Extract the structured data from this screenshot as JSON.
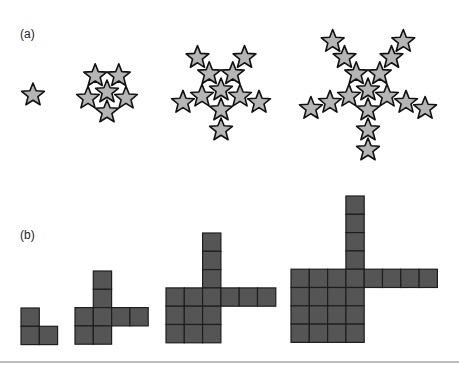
{
  "figure": {
    "panels": [
      {
        "id": "a",
        "label": "(a)",
        "label_pos": [
          20,
          27
        ]
      },
      {
        "id": "b",
        "label": "(b)",
        "label_pos": [
          20,
          228
        ]
      }
    ],
    "colors": {
      "star_fill": "#b5b5b5",
      "star_stroke": "#111111",
      "square_fill": "#555555",
      "square_stroke": "#1e1e1e",
      "rule": "#bdbdbd"
    },
    "star_fractals": {
      "outer_radius": 12,
      "inner_radius": 5.2,
      "ring_spacing": 20,
      "generations": [
        {
          "stage": 1,
          "center": [
            33,
            95
          ],
          "rings": 0
        },
        {
          "stage": 2,
          "center": [
            107,
            92
          ],
          "rings": 1
        },
        {
          "stage": 3,
          "center": [
            221,
            90
          ],
          "rings": 2
        },
        {
          "stage": 4,
          "center": [
            368,
            90
          ],
          "rings": 3
        }
      ]
    },
    "square_fractals": {
      "cell_size": 18.3,
      "generations": [
        {
          "stage": 1,
          "origin": [
            21,
            308
          ],
          "cells": [
            [
              0,
              0
            ],
            [
              0,
              1
            ],
            [
              1,
              1
            ]
          ]
        },
        {
          "stage": 2,
          "origin": [
            75,
            271
          ],
          "cells": [
            [
              1,
              0
            ],
            [
              1,
              1
            ],
            [
              0,
              2
            ],
            [
              1,
              2
            ],
            [
              2,
              2
            ],
            [
              3,
              2
            ],
            [
              0,
              3
            ],
            [
              1,
              3
            ]
          ]
        },
        {
          "stage": 3,
          "origin": [
            166,
            233
          ],
          "cells": [
            [
              2,
              0
            ],
            [
              2,
              1
            ],
            [
              2,
              2
            ],
            [
              0,
              3
            ],
            [
              1,
              3
            ],
            [
              2,
              3
            ],
            [
              3,
              3
            ],
            [
              4,
              3
            ],
            [
              5,
              3
            ],
            [
              0,
              4
            ],
            [
              1,
              4
            ],
            [
              2,
              4
            ],
            [
              0,
              5
            ],
            [
              1,
              5
            ],
            [
              2,
              5
            ]
          ]
        },
        {
          "stage": 4,
          "origin": [
            291,
            196
          ],
          "cells": [
            [
              3,
              0
            ],
            [
              3,
              1
            ],
            [
              3,
              2
            ],
            [
              3,
              3
            ],
            [
              0,
              4
            ],
            [
              1,
              4
            ],
            [
              2,
              4
            ],
            [
              3,
              4
            ],
            [
              4,
              4
            ],
            [
              5,
              4
            ],
            [
              6,
              4
            ],
            [
              7,
              4
            ],
            [
              0,
              5
            ],
            [
              1,
              5
            ],
            [
              2,
              5
            ],
            [
              3,
              5
            ],
            [
              0,
              6
            ],
            [
              1,
              6
            ],
            [
              2,
              6
            ],
            [
              3,
              6
            ],
            [
              0,
              7
            ],
            [
              1,
              7
            ],
            [
              2,
              7
            ],
            [
              3,
              7
            ]
          ]
        }
      ]
    }
  }
}
